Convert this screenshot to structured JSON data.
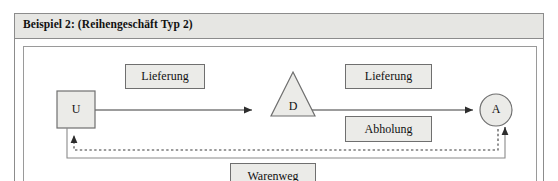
{
  "example": {
    "title": "Beispiel 2: (Reihengeschäft Typ 2)"
  },
  "diagram": {
    "nodes": [
      {
        "id": "U",
        "label": "U",
        "shape": "square"
      },
      {
        "id": "D",
        "label": "D",
        "shape": "triangle"
      },
      {
        "id": "A",
        "label": "A",
        "shape": "circle"
      }
    ],
    "callouts": [
      {
        "id": "lieferung-1",
        "label": "Lieferung"
      },
      {
        "id": "lieferung-2",
        "label": "Lieferung"
      },
      {
        "id": "abholung",
        "label": "Abholung"
      },
      {
        "id": "warenweg",
        "label": "Warenweg"
      }
    ],
    "edges": [
      {
        "id": "u-to-d",
        "from": "U",
        "to": "D",
        "style": "solid",
        "label": "Lieferung"
      },
      {
        "id": "d-to-a",
        "from": "D",
        "to": "A",
        "style": "solid",
        "label": "Lieferung"
      },
      {
        "id": "a-to-u-dashed",
        "from": "A",
        "to": "U",
        "style": "dashed",
        "label": "Abholung"
      },
      {
        "id": "a-to-u-solid",
        "from": "A",
        "to": "U",
        "style": "solid",
        "label": "Warenweg"
      }
    ]
  },
  "colors": {
    "shape_fill": "#ebebe8",
    "shape_stroke": "#6f6f6f",
    "line": "#3a3a3a",
    "header_bg": "#e6e6e3",
    "frame_border": "#8c8c8c",
    "text": "#111111"
  }
}
